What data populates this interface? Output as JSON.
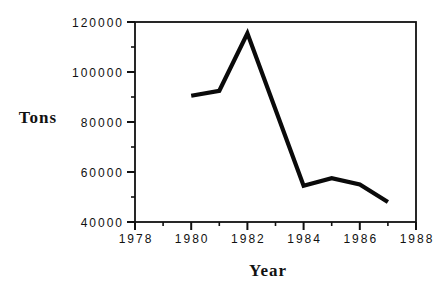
{
  "window": {
    "background_color": "#ffffff"
  },
  "chart": {
    "frame_color": "#111111",
    "line_color": "#0a0a0a",
    "text_color": "#111111"
  },
  "chart_data": {
    "type": "line",
    "title": "",
    "xlabel": "Year",
    "ylabel": "Tons",
    "x": [
      1980,
      1981,
      1982,
      1984,
      1985,
      1986,
      1987
    ],
    "y": [
      90500,
      92500,
      115500,
      54500,
      57500,
      55000,
      48000
    ],
    "xlim": [
      1978,
      1988
    ],
    "ylim": [
      40000,
      120000
    ],
    "x_major_ticks": [
      1978,
      1980,
      1982,
      1984,
      1986,
      1988
    ],
    "x_minor_ticks": [
      1979,
      1981,
      1983,
      1985,
      1987
    ],
    "y_major_ticks": [
      40000,
      60000,
      80000,
      100000,
      120000
    ],
    "y_minor_ticks": [
      50000,
      70000,
      90000,
      110000
    ],
    "x_tick_labels": [
      "1978",
      "1980",
      "1982",
      "1984",
      "1986",
      "1988"
    ],
    "y_tick_labels": [
      "40000",
      "60000",
      "80000",
      "100000",
      "120000"
    ],
    "grid": false,
    "legend": null,
    "frame": true,
    "tick_direction": "out"
  }
}
